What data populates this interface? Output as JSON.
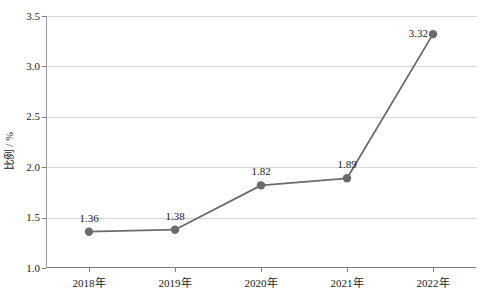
{
  "chart_data": {
    "type": "line",
    "title": "",
    "xlabel": "",
    "ylabel": "比例 / %",
    "categories": [
      "2018年",
      "2019年",
      "2020年",
      "2021年",
      "2022年"
    ],
    "values": [
      1.36,
      1.38,
      1.82,
      1.89,
      3.32
    ],
    "point_labels": [
      "1.36",
      "1.38",
      "1.82",
      "1.89",
      "3.32"
    ],
    "ylim": [
      1.0,
      3.5
    ],
    "ytick_labels": [
      "1.0",
      "1.5",
      "2.0",
      "2.5",
      "3.0",
      "3.5"
    ],
    "ytick_values": [
      1.0,
      1.5,
      2.0,
      2.5,
      3.0,
      3.5
    ],
    "grid": "horizontal",
    "legend": "none",
    "series_color": "#6b6b6b",
    "marker": "circle",
    "marker_color": "#6b6b6b",
    "grid_color": "#d6d6d6",
    "axis_color": "#7d7d7d",
    "background_color": "#ffffff",
    "text_color": "#1a1a1a"
  }
}
